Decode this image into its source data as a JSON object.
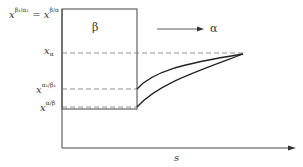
{
  "diagram": {
    "top_label": {
      "lhs_base": "x",
      "lhs_sup": "β₁/α₁",
      "lhs_sub": "β₁",
      "eq": "=",
      "rhs_base": "x",
      "rhs_sup": "β/α",
      "rhs_sub": "β"
    },
    "phase_beta": "β",
    "phase_alpha": "α",
    "y_labels": [
      {
        "base": "x",
        "sub": "α",
        "sup": ""
      },
      {
        "base": "x",
        "sub": "α",
        "sup": "α₁/β₁"
      },
      {
        "base": "x",
        "sub": "α",
        "sup": "α/β"
      }
    ],
    "x_axis_label": "s",
    "colors": {
      "line": "#333333",
      "dash": "#666666"
    }
  }
}
